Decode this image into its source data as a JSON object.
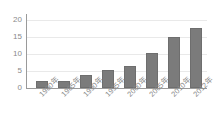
{
  "chart_data": {
    "type": "bar",
    "title": "",
    "subtitle": "",
    "xlabel": "",
    "ylabel": "",
    "categories": [
      "1980年",
      "1985年",
      "1990年",
      "1995年",
      "2000年",
      "2005年",
      "2010年",
      "2012年"
    ],
    "values": [
      2.2,
      2.2,
      3.8,
      5.2,
      6.6,
      10.4,
      15.0,
      17.7
    ],
    "series": [
      {
        "name": "",
        "values": [
          2.2,
          2.2,
          3.8,
          5.2,
          6.6,
          10.4,
          15.0,
          17.7
        ]
      }
    ],
    "ylim": [
      0,
      20
    ],
    "yticks": [
      0,
      5,
      10,
      15,
      20
    ],
    "ytick_labels": [
      "0",
      "5",
      "10",
      "15",
      "20"
    ],
    "grid": true,
    "grid_axis": "y",
    "legend": false,
    "legend_position": "none",
    "bar_color": "#7b7b7b",
    "bar_edge_color": "#6e6e6e",
    "gridline_color": "#e9e9e9",
    "axis_color": "#9a9a9a",
    "tick_label_color": "#8a8a8a",
    "background_color": "#ffffff",
    "xtick_label_rotation": -45
  }
}
